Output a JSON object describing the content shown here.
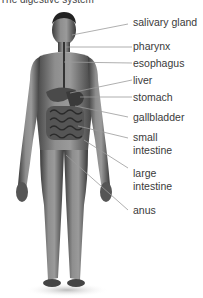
{
  "title": "The digestive system",
  "labels": [
    {
      "id": "salivary-gland",
      "text": "salivary gland"
    },
    {
      "id": "pharynx",
      "text": "pharynx"
    },
    {
      "id": "esophagus",
      "text": "esophagus"
    },
    {
      "id": "liver",
      "text": "liver"
    },
    {
      "id": "stomach",
      "text": "stomach"
    },
    {
      "id": "gallbladder",
      "text": "gallbladder"
    },
    {
      "id": "small-intestine-1",
      "text": "small"
    },
    {
      "id": "small-intestine-2",
      "text": "intestine"
    },
    {
      "id": "large-intestine-1",
      "text": "large"
    },
    {
      "id": "large-intestine-2",
      "text": "intestine"
    },
    {
      "id": "anus",
      "text": "anus"
    }
  ],
  "colors": {
    "leader_line": "#9a9a9a",
    "skin_dark": "#4a4a4a",
    "skin_light": "#9c9c9c",
    "organ": "#5a5a5a"
  }
}
